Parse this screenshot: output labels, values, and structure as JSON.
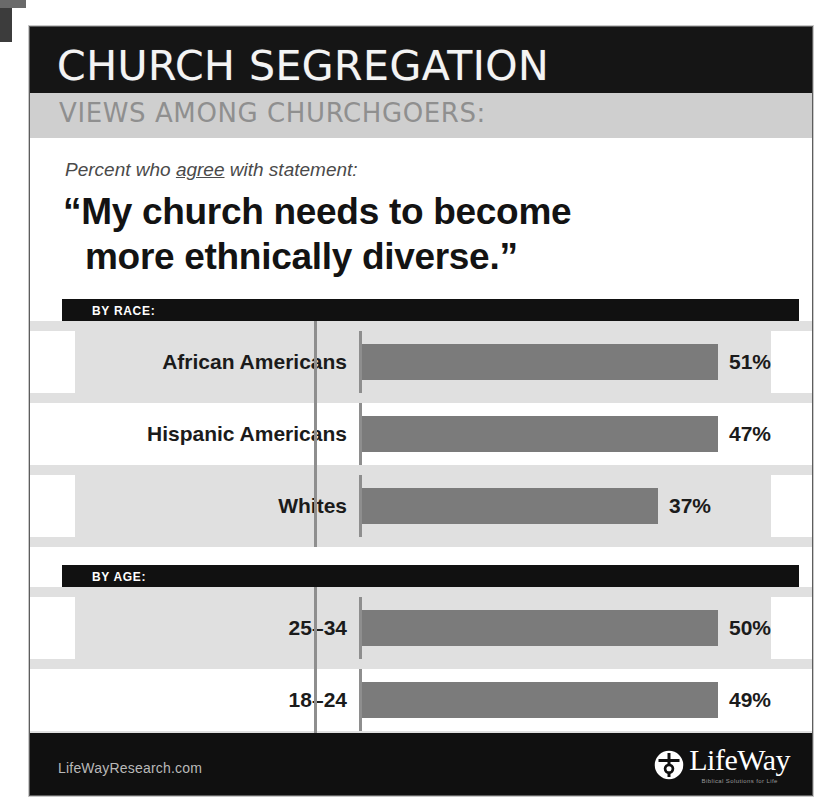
{
  "header": {
    "title": "CHURCH SEGREGATION",
    "subtitle": "VIEWS AMONG CHURCHGOERS:"
  },
  "statement": {
    "kicker_before": "Percent who ",
    "kicker_emphasis": "agree",
    "kicker_after": " with statement:",
    "quote_line_1": "“My church needs to become",
    "quote_line_2": "more ethnically diverse.”"
  },
  "footer": {
    "url": "LifeWayResearch.com",
    "logo_name": "LifeWay",
    "logo_tagline": "Biblical Solutions for Life",
    "logo_icon": "lifeway-circle-mark-icon"
  },
  "colors": {
    "header_black": "#151515",
    "header_gray": "#cfcfcf",
    "bar_gray": "#7b7b7b",
    "row_shade": "#e0e0e0",
    "baseline_gray": "#8e8e8e",
    "text_dark": "#1b1b1b"
  },
  "chart_data": {
    "type": "bar",
    "title": "CHURCH SEGREGATION",
    "subtitle": "VIEWS AMONG CHURCHGOERS:",
    "annotation": "Percent who agree with statement: “My church needs to become more ethnically diverse.”",
    "xlabel": "",
    "ylabel": "",
    "xlim": [
      0,
      60
    ],
    "grid": false,
    "legend": null,
    "orientation": "horizontal",
    "value_suffix": "%",
    "groups": [
      {
        "heading": "BY RACE:",
        "categories": [
          "African Americans",
          "Hispanic Americans",
          "Whites"
        ],
        "values": [
          51,
          47,
          37
        ],
        "labels": [
          "51%",
          "47%",
          "37%"
        ]
      },
      {
        "heading": "BY AGE:",
        "categories": [
          "25–34",
          "18–24",
          "65 and older"
        ],
        "values": [
          50,
          49,
          36
        ],
        "labels": [
          "50%",
          "49%",
          "36%"
        ]
      }
    ]
  }
}
